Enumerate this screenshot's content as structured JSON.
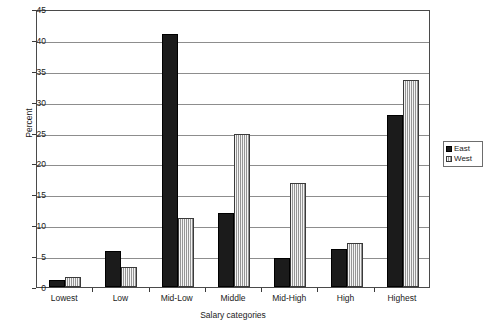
{
  "chart_data": {
    "type": "bar",
    "title": "",
    "xlabel": "Salary categories",
    "ylabel": "Percent",
    "categories": [
      "Lowest",
      "Low",
      "Mid-Low",
      "Middle",
      "Mid-High",
      "High",
      "Highest"
    ],
    "series": [
      {
        "name": "East",
        "color": "#1b1b1b",
        "values": [
          1.2,
          5.9,
          41.0,
          12.0,
          4.7,
          6.1,
          27.8
        ]
      },
      {
        "name": "West",
        "color": "#b8b8b8",
        "values": [
          1.6,
          3.2,
          11.2,
          24.8,
          16.8,
          7.2,
          33.5
        ]
      }
    ],
    "ylim": [
      0,
      45
    ],
    "yticks": [
      0,
      5,
      10,
      15,
      20,
      25,
      30,
      35,
      40,
      45
    ],
    "ytick_labels": [
      "0",
      "5",
      "10",
      "15",
      "20",
      "25",
      "30",
      "35",
      "40",
      "45"
    ],
    "grid": true,
    "legend_position": "right",
    "legend_entries": [
      "East",
      "West"
    ]
  }
}
